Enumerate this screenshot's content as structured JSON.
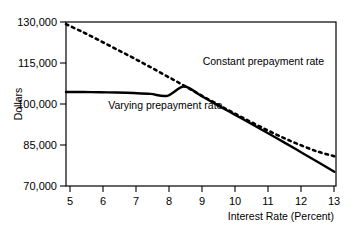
{
  "chart_data": {
    "type": "line",
    "title": "",
    "subtitle": "",
    "xlabel": "Interest Rate (Percent)",
    "ylabel": "Dollars",
    "xlim": [
      5,
      13
    ],
    "ylim": [
      70000,
      130000
    ],
    "xticks": [
      "5",
      "6",
      "7",
      "8",
      "9",
      "10",
      "11",
      "12",
      "13"
    ],
    "yticks": [
      "70,000",
      "85,000",
      "100,000",
      "115,000",
      "130,000"
    ],
    "ytick_values": [
      70000,
      85000,
      100000,
      115000,
      130000
    ],
    "xtick_values": [
      5,
      6,
      7,
      8,
      9,
      10,
      11,
      12,
      13
    ],
    "grid": false,
    "legend_position": "inline-annotations",
    "frame": "full-box",
    "line_color": "#000000",
    "series": [
      {
        "name": "Constant prepayment rate",
        "style": "dotted",
        "annotation": "Constant prepayment rate",
        "annotation_x": 9.05,
        "annotation_y": 114200,
        "x": [
          5.0,
          5.5,
          6.0,
          6.5,
          7.0,
          7.5,
          8.0,
          8.5,
          9.0,
          9.5,
          10.0,
          10.5,
          11.0,
          11.5,
          12.0,
          12.5,
          12.95
        ],
        "values": [
          129200,
          126300,
          123200,
          120000,
          116800,
          113500,
          110100,
          106700,
          103200,
          99800,
          96500,
          93300,
          90200,
          87300,
          84700,
          82400,
          80900
        ]
      },
      {
        "name": "Varying prepayment rate",
        "style": "solid",
        "annotation": "Varying prepayment rate",
        "annotation_x": 6.25,
        "annotation_y": 98200,
        "x": [
          5.0,
          5.5,
          6.0,
          6.5,
          7.0,
          7.5,
          8.0,
          8.5,
          9.0,
          9.5,
          10.0,
          10.5,
          11.0,
          11.5,
          12.0,
          12.5,
          12.95
        ],
        "values": [
          104400,
          104400,
          104300,
          104200,
          104000,
          103700,
          103000,
          106400,
          103000,
          99500,
          96100,
          92700,
          89200,
          85700,
          82100,
          78500,
          75200
        ]
      }
    ]
  },
  "axes": {
    "y_axis_title": "Dollars",
    "x_axis_title": "Interest Rate (Percent)"
  }
}
